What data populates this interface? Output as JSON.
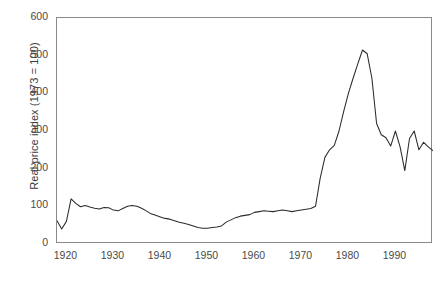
{
  "chart_data": {
    "type": "line",
    "title": "",
    "subtitle": "",
    "xlabel": "",
    "ylabel": "Real price index (1973 = 100)",
    "xlim": [
      1918,
      1998
    ],
    "ylim": [
      0,
      600
    ],
    "xticks": [
      1920,
      1930,
      1940,
      1950,
      1960,
      1970,
      1980,
      1990
    ],
    "yticks": [
      0,
      100,
      200,
      300,
      400,
      500,
      600
    ],
    "grid": false,
    "legend": null,
    "legend_position": "none",
    "line_color": "#2b2b2b",
    "axis_color": "#8a8a8a",
    "series": [
      {
        "name": "Real price index",
        "x": [
          1918,
          1919,
          1920,
          1921,
          1922,
          1923,
          1924,
          1925,
          1926,
          1927,
          1928,
          1929,
          1930,
          1931,
          1932,
          1933,
          1934,
          1935,
          1936,
          1937,
          1938,
          1939,
          1940,
          1941,
          1942,
          1943,
          1944,
          1945,
          1946,
          1947,
          1948,
          1949,
          1950,
          1951,
          1952,
          1953,
          1954,
          1955,
          1956,
          1957,
          1958,
          1959,
          1960,
          1961,
          1962,
          1963,
          1964,
          1965,
          1966,
          1967,
          1968,
          1969,
          1970,
          1971,
          1972,
          1973,
          1974,
          1975,
          1976,
          1977,
          1978,
          1979,
          1980,
          1981,
          1982,
          1983,
          1984,
          1985,
          1986,
          1987,
          1988,
          1989,
          1990,
          1991,
          1992,
          1993,
          1994,
          1995,
          1996,
          1997,
          1998
        ],
        "values": [
          62,
          40,
          60,
          120,
          108,
          99,
          102,
          98,
          95,
          93,
          97,
          96,
          90,
          88,
          94,
          100,
          102,
          100,
          95,
          88,
          80,
          76,
          72,
          68,
          66,
          62,
          58,
          55,
          52,
          48,
          44,
          42,
          42,
          44,
          45,
          48,
          58,
          64,
          70,
          74,
          76,
          78,
          84,
          86,
          88,
          87,
          86,
          88,
          90,
          88,
          86,
          88,
          90,
          92,
          94,
          100,
          175,
          230,
          250,
          262,
          300,
          352,
          400,
          440,
          478,
          515,
          505,
          440,
          320,
          290,
          282,
          260,
          300,
          258,
          195,
          280,
          300,
          250,
          270,
          258,
          248
        ]
      }
    ]
  },
  "axes": {
    "y_tick_labels": [
      "600",
      "500",
      "400",
      "300",
      "200",
      "100",
      "0"
    ],
    "x_tick_labels": [
      "1920",
      "1930",
      "1940",
      "1950",
      "1960",
      "1970",
      "1980",
      "1990"
    ]
  },
  "caption": {
    "text": ""
  }
}
